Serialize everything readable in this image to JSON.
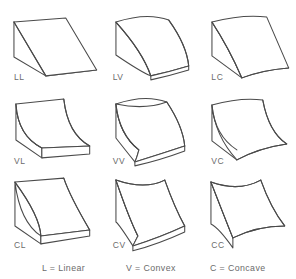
{
  "figure": {
    "line_color": "#4a4a4a",
    "fill_color": "#ffffff",
    "text_color": "#6b6b6b",
    "background": "#ffffff"
  },
  "grid": {
    "rows": 3,
    "columns": 3,
    "cells": [
      {
        "label": "LL",
        "profile": "Linear",
        "sweep": "Linear",
        "description": "Flat triangular wedge ramp, straight in both directions"
      },
      {
        "label": "LV",
        "profile": "Linear",
        "sweep": "Convex",
        "description": "Straight profile swept along a convex path"
      },
      {
        "label": "LC",
        "profile": "Linear",
        "sweep": "Concave",
        "description": "Straight profile swept along a concave path"
      },
      {
        "label": "VL",
        "profile": "Convex",
        "sweep": "Linear",
        "description": "Convex quarter-round profile extruded straight"
      },
      {
        "label": "VV",
        "profile": "Convex",
        "sweep": "Convex",
        "description": "Convex in both directions, dome-like bulge"
      },
      {
        "label": "VC",
        "profile": "Convex",
        "sweep": "Concave",
        "description": "Convex profile swept along a concave path"
      },
      {
        "label": "CL",
        "profile": "Concave",
        "sweep": "Linear",
        "description": "Concave scooped profile extruded straight"
      },
      {
        "label": "CV",
        "profile": "Concave",
        "sweep": "Convex",
        "description": "Concave profile swept along a convex path"
      },
      {
        "label": "CC",
        "profile": "Concave",
        "sweep": "Concave",
        "description": "Concave in both directions, saddle hollow"
      }
    ]
  },
  "legend": {
    "entries": [
      {
        "key": "L",
        "separator": "=",
        "term": "Linear",
        "text": "L = Linear"
      },
      {
        "key": "V",
        "separator": "=",
        "term": "Convex",
        "text": "V = Convex"
      },
      {
        "key": "C",
        "separator": "=",
        "term": "Concave",
        "text": "C = Concave"
      }
    ]
  }
}
